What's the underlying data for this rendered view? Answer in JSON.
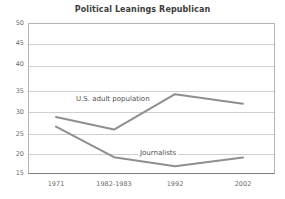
{
  "chart_data": {
    "type": "line",
    "title": "Political Leanings Republican",
    "xlabel": "",
    "ylabel": "",
    "categories": [
      "1971",
      "1982-1983",
      "1992",
      "2002"
    ],
    "series": [
      {
        "name": "U.S. adult population",
        "values": [
          28.2,
          25.3,
          33.5,
          31.3
        ],
        "color": "#8f8f8f"
      },
      {
        "name": "Journalists",
        "values": [
          26.0,
          18.9,
          16.8,
          18.8
        ],
        "color": "#8f8f8f"
      }
    ],
    "ylim": [
      15,
      50
    ],
    "yticks": [
      15,
      20,
      25,
      30,
      35,
      40,
      45,
      50
    ],
    "ytick_labels": [
      "15",
      "20",
      "25",
      "30",
      "35",
      "40",
      "45",
      "50"
    ],
    "grid": true,
    "legend": "inline-annotations",
    "annotations": [
      {
        "text": "U.S. adult population",
        "series": "U.S. adult population"
      },
      {
        "text": "Journalists",
        "series": "Journalists"
      }
    ]
  },
  "colors": {
    "line": "#8f8f8f",
    "grid": "#cfcfcf",
    "axis": "#7d7d7d",
    "title_text": "#3d3d3d",
    "tick_text": "#6b6b6b",
    "background": "#ffffff"
  }
}
